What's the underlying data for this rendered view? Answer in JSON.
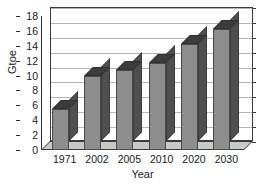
{
  "chart_data": {
    "type": "bar",
    "title": "",
    "categories": [
      "1971",
      "2002",
      "2005",
      "2010",
      "2020",
      "2030"
    ],
    "values": [
      5.5,
      10.0,
      10.8,
      11.7,
      14.2,
      16.3
    ],
    "series": [
      {
        "name": "World primary energy demand",
        "values": [
          5.5,
          10.0,
          10.8,
          11.7,
          14.2,
          16.3
        ]
      }
    ],
    "xlabel": "Year",
    "ylabel": "Gtoe",
    "ylim": [
      0,
      18
    ],
    "ytick_step": 2,
    "yticks": [
      "18",
      "16",
      "14",
      "12",
      "10",
      "8",
      "6",
      "4",
      "2",
      "0"
    ],
    "ytick_values": [
      18,
      16,
      14,
      12,
      10,
      8,
      6,
      4,
      2,
      0
    ],
    "grid": true,
    "grid_axis": "y",
    "legend": false,
    "legend_position": "none",
    "style": "3d-column",
    "bar_color": "#8d8d8d",
    "bar_side_color": "#4f4f4f",
    "bar_top_color": "#3c3c3c",
    "gridline_color": "#b5b5b5",
    "axis_color": "#2a2a2a",
    "background_color": "#ffffff",
    "annotations": []
  }
}
